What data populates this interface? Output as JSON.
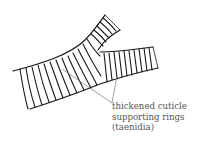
{
  "diagram": {
    "annotation": {
      "lines": [
        "thickened cuticle",
        "supporting rings",
        "(taenidia)"
      ]
    },
    "colors": {
      "ink": "#1a1a1a",
      "pointer": "#777777",
      "label": "#555555",
      "background": "#ffffff"
    }
  }
}
